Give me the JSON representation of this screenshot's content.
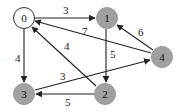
{
  "graph": {
    "type": "directed-weighted",
    "nodes": [
      {
        "id": "0",
        "label": "0",
        "x": 24,
        "y": 18,
        "fill": "#ffffff"
      },
      {
        "id": "1",
        "label": "1",
        "x": 107,
        "y": 18,
        "fill": "#a0a0a0"
      },
      {
        "id": "2",
        "label": "2",
        "x": 105,
        "y": 94,
        "fill": "#a0a0a0"
      },
      {
        "id": "3",
        "label": "3",
        "x": 24,
        "y": 94,
        "fill": "#a0a0a0"
      },
      {
        "id": "4",
        "label": "4",
        "x": 162,
        "y": 57,
        "fill": "#a0a0a0"
      }
    ],
    "edges": [
      {
        "from": "0",
        "to": "1",
        "weight": "3"
      },
      {
        "from": "4",
        "to": "0",
        "weight": "7"
      },
      {
        "from": "2",
        "to": "0",
        "weight": "4"
      },
      {
        "from": "0",
        "to": "3",
        "weight": "4"
      },
      {
        "from": "4",
        "to": "1",
        "weight": "6"
      },
      {
        "from": "1",
        "to": "2",
        "weight": "5"
      },
      {
        "from": "3",
        "to": "4",
        "weight": "3"
      },
      {
        "from": "2",
        "to": "3",
        "weight": "5"
      }
    ]
  }
}
